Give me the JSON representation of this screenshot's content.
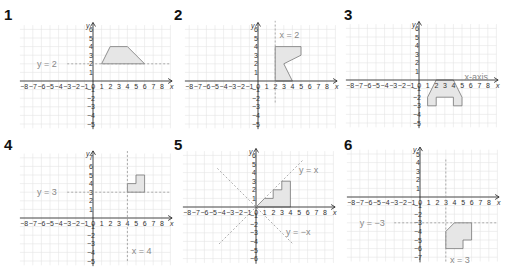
{
  "graphs": [
    {
      "id": 1,
      "label": "1",
      "origin": [
        93,
        81
      ],
      "unit": 8.6,
      "xrange": [
        -8,
        8
      ],
      "yrange": [
        -5,
        6
      ],
      "shape": [
        [
          1,
          2
        ],
        [
          2,
          4
        ],
        [
          4,
          4
        ],
        [
          6,
          2
        ]
      ],
      "lines": [
        {
          "type": "h",
          "value": 2,
          "label": "y = 2",
          "from": -3,
          "to": 9,
          "label_pos": [
            -6.5,
            2
          ]
        }
      ]
    },
    {
      "id": 2,
      "label": "2",
      "origin": [
        258,
        81
      ],
      "unit": 8.6,
      "xrange": [
        -8,
        8
      ],
      "yrange": [
        -5,
        6
      ],
      "shape": [
        [
          2,
          0
        ],
        [
          2,
          4
        ],
        [
          5,
          4
        ],
        [
          5,
          3
        ],
        [
          3,
          2
        ],
        [
          4,
          0
        ]
      ],
      "lines": [
        {
          "type": "v",
          "value": 2,
          "label": "x = 2",
          "from": -2.5,
          "to": 7,
          "label_pos": [
            2.5,
            5.3
          ]
        }
      ]
    },
    {
      "id": 3,
      "label": "3",
      "origin": [
        419,
        80
      ],
      "unit": 8.6,
      "xrange": [
        -8,
        8
      ],
      "yrange": [
        -5,
        6
      ],
      "shape": [
        [
          2,
          0
        ],
        [
          4,
          0
        ],
        [
          5,
          -2
        ],
        [
          5,
          -3
        ],
        [
          4,
          -3
        ],
        [
          4,
          -2
        ],
        [
          2,
          -2
        ],
        [
          2,
          -3
        ],
        [
          1,
          -3
        ],
        [
          1,
          -2
        ]
      ],
      "lines": [
        {
          "type": "label_only",
          "label": "x-axis",
          "label_pos": [
            5.3,
            0.3
          ]
        }
      ]
    },
    {
      "id": 4,
      "label": "4",
      "origin": [
        93,
        218
      ],
      "unit": 8.6,
      "xrange": [
        -8,
        8
      ],
      "yrange": [
        -5,
        7
      ],
      "shape": [
        [
          4,
          3
        ],
        [
          4,
          4
        ],
        [
          5,
          4
        ],
        [
          5,
          5
        ],
        [
          6,
          5
        ],
        [
          6,
          3
        ]
      ],
      "lines": [
        {
          "type": "h",
          "value": 3,
          "label": "y = 3",
          "from": -3,
          "to": 9,
          "label_pos": [
            -6.5,
            3
          ]
        },
        {
          "type": "v",
          "value": 4,
          "label": "x = 4",
          "from": -5,
          "to": 8,
          "label_pos": [
            4.5,
            -3.8
          ]
        }
      ]
    },
    {
      "id": 5,
      "label": "5",
      "origin": [
        256,
        207
      ],
      "unit": 8.6,
      "xrange": [
        -8,
        8
      ],
      "yrange": [
        -6,
        6
      ],
      "shape": [
        [
          0,
          0
        ],
        [
          1,
          1
        ],
        [
          2,
          1
        ],
        [
          2,
          2
        ],
        [
          3,
          2
        ],
        [
          3,
          3
        ],
        [
          4,
          3
        ],
        [
          4,
          0
        ]
      ],
      "lines": [
        {
          "type": "diag",
          "slope": 1,
          "from": -4.3,
          "to": 5.5,
          "label": "y = x",
          "label_pos": [
            5,
            4.3
          ]
        },
        {
          "type": "diag",
          "slope": -1,
          "from": -4.5,
          "to": 4.3,
          "label": "y = −x",
          "label_pos": [
            3.5,
            -2.9
          ]
        }
      ]
    },
    {
      "id": 6,
      "label": "6",
      "origin": [
        420,
        197
      ],
      "unit": 8.6,
      "xrange": [
        -8,
        8
      ],
      "yrange": [
        -7,
        5
      ],
      "shape": [
        [
          3,
          -4
        ],
        [
          4,
          -3
        ],
        [
          6,
          -3
        ],
        [
          6,
          -5
        ],
        [
          5,
          -5
        ],
        [
          5,
          -6
        ],
        [
          3,
          -6
        ]
      ],
      "lines": [
        {
          "type": "h",
          "value": -3,
          "label": "y = −3",
          "from": -3,
          "to": 9,
          "label_pos": [
            -7,
            -3
          ]
        },
        {
          "type": "v",
          "value": 3,
          "label": "x = 3",
          "from": -7.5,
          "to": 4.5,
          "label_pos": [
            3.5,
            -7.3
          ]
        }
      ]
    }
  ],
  "axis_labels": {
    "x": "x",
    "y": "y"
  },
  "colors": {
    "grid": "#e4e4e4",
    "axis": "#222222",
    "shape_fill": "#e6e6e6",
    "shape_stroke": "#777777",
    "dashed": "#999999",
    "label": "#888888"
  }
}
